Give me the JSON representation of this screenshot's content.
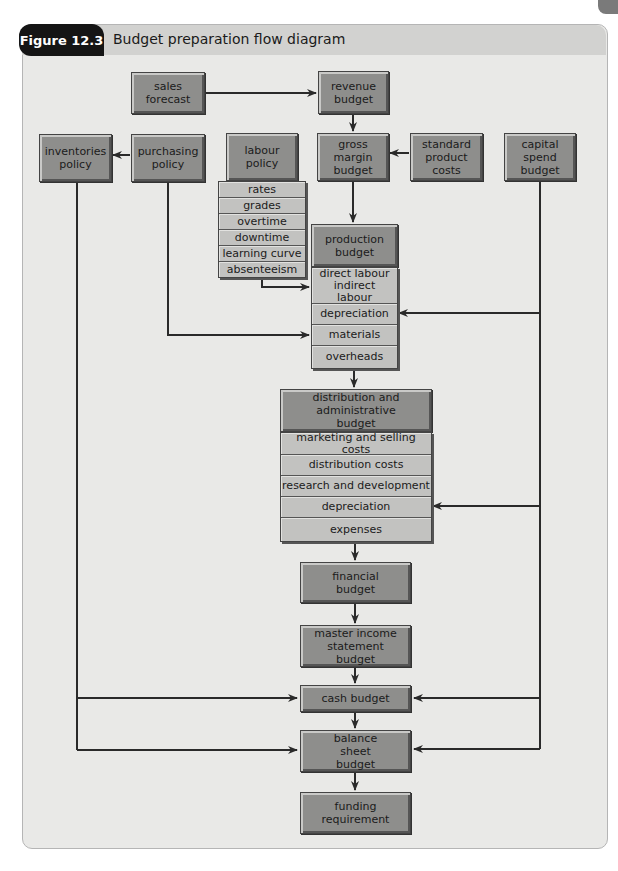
{
  "figure": {
    "label": "Figure 12.3",
    "title": "Budget preparation flow diagram"
  },
  "nodes": {
    "sales_forecast": "sales forecast",
    "revenue_budget": "revenue budget",
    "inventories_policy": "inventories policy",
    "purchasing_policy": "purchasing policy",
    "labour_policy": "labour policy",
    "gross_margin_budget": "gross margin budget",
    "standard_product_costs": "standard product costs",
    "capital_spend_budget": "capital spend budget",
    "production_budget": "production budget",
    "distribution_admin_budget": "distribution and administrative budget",
    "financial_budget": "financial budget",
    "master_income_statement_budget": "master income statement budget",
    "cash_budget": "cash budget",
    "balance_sheet_budget": "balance sheet budget",
    "funding_requirement": "funding requirement"
  },
  "labour_items": [
    "rates",
    "grades",
    "overtime",
    "downtime",
    "learning curve",
    "absenteeism"
  ],
  "production_items": [
    "direct labour indirect labour",
    "depreciation",
    "materials",
    "overheads"
  ],
  "distribution_items": [
    "marketing and selling costs",
    "distribution costs",
    "research and development",
    "depreciation",
    "expenses"
  ],
  "colors": {
    "panel_bg": "#e9e9e7",
    "title_strip": "#d2d2d0",
    "box_fill": "#8e8e8c",
    "list_fill": "#c2c2c0",
    "figure_label_bg": "#151515",
    "line": "#2a2a2a"
  },
  "edges": [
    [
      "sales forecast",
      "revenue budget"
    ],
    [
      "revenue budget",
      "gross margin budget"
    ],
    [
      "purchasing policy",
      "inventories policy"
    ],
    [
      "standard product costs",
      "gross margin budget"
    ],
    [
      "gross margin budget",
      "production budget"
    ],
    [
      "labour policy",
      "production budget: direct/indirect labour"
    ],
    [
      "purchasing policy",
      "production budget: materials"
    ],
    [
      "capital spend budget",
      "production budget: depreciation"
    ],
    [
      "production budget",
      "distribution and administrative budget"
    ],
    [
      "capital spend budget",
      "distribution and administrative budget: depreciation"
    ],
    [
      "distribution and administrative budget",
      "financial budget"
    ],
    [
      "financial budget",
      "master income statement budget"
    ],
    [
      "master income statement budget",
      "cash budget"
    ],
    [
      "inventories policy",
      "cash budget"
    ],
    [
      "capital spend budget",
      "cash budget"
    ],
    [
      "cash budget",
      "balance sheet budget"
    ],
    [
      "inventories policy",
      "balance sheet budget"
    ],
    [
      "capital spend budget",
      "balance sheet budget"
    ],
    [
      "balance sheet budget",
      "funding requirement"
    ]
  ]
}
